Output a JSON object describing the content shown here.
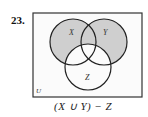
{
  "problem": {
    "number": "23.",
    "formula": "(X ∪ Y) − Z"
  },
  "diagram": {
    "universe_label": "U",
    "sets": [
      {
        "label": "X",
        "cx": 73,
        "cy": 42,
        "r": 23
      },
      {
        "label": "Y",
        "cx": 104,
        "cy": 42,
        "r": 23
      },
      {
        "label": "Z",
        "cx": 88,
        "cy": 67,
        "r": 23
      }
    ],
    "shaded_region": "(X ∪ Y) − Z",
    "colors": {
      "shade": "#cfcfcf",
      "stroke": "#222222",
      "background": "#ffffff",
      "box_fill": "#fbfbfb"
    }
  }
}
